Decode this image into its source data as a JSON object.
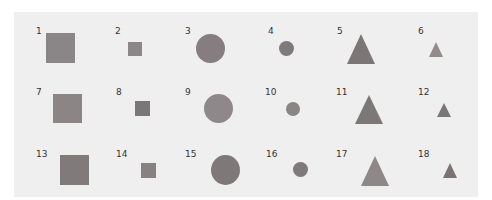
{
  "panel": {
    "background": "#efefef"
  },
  "items": [
    {
      "id": "1",
      "label": "1",
      "shape": "square",
      "size": "large",
      "color": "#8a8586",
      "lx": 36,
      "ly": 26,
      "x": 46,
      "y": 33,
      "w": 29,
      "h": 30
    },
    {
      "id": "2",
      "label": "2",
      "shape": "square",
      "size": "small",
      "color": "#8b8687",
      "lx": 115,
      "ly": 26,
      "x": 128,
      "y": 42,
      "w": 14,
      "h": 14
    },
    {
      "id": "3",
      "label": "3",
      "shape": "circle",
      "size": "large",
      "color": "#857d7f",
      "lx": 185,
      "ly": 26,
      "x": 196,
      "y": 34,
      "w": 29,
      "h": 29
    },
    {
      "id": "4",
      "label": "4",
      "shape": "circle",
      "size": "small",
      "color": "#7f7a7b",
      "lx": 268,
      "ly": 26,
      "x": 279,
      "y": 41,
      "w": 15,
      "h": 15
    },
    {
      "id": "5",
      "label": "5",
      "shape": "triangle",
      "size": "large",
      "color": "#7c7677",
      "lx": 337,
      "ly": 26,
      "x": 347,
      "y": 34,
      "w": 29,
      "h": 30
    },
    {
      "id": "6",
      "label": "6",
      "shape": "triangle",
      "size": "small",
      "color": "#918b8c",
      "lx": 418,
      "ly": 26,
      "x": 429,
      "y": 42,
      "w": 14,
      "h": 15
    },
    {
      "id": "7",
      "label": "7",
      "shape": "square",
      "size": "large",
      "color": "#8b8586",
      "lx": 36,
      "ly": 87,
      "x": 53,
      "y": 94,
      "w": 29,
      "h": 29
    },
    {
      "id": "8",
      "label": "8",
      "shape": "square",
      "size": "small",
      "color": "#7b7677",
      "lx": 116,
      "ly": 87,
      "x": 135,
      "y": 101,
      "w": 15,
      "h": 15
    },
    {
      "id": "9",
      "label": "9",
      "shape": "circle",
      "size": "large",
      "color": "#8f888a",
      "lx": 185,
      "ly": 87,
      "x": 204,
      "y": 94,
      "w": 29,
      "h": 29
    },
    {
      "id": "10",
      "label": "10",
      "shape": "circle",
      "size": "small",
      "color": "#8b8586",
      "lx": 265,
      "ly": 87,
      "x": 286,
      "y": 102,
      "w": 14,
      "h": 14
    },
    {
      "id": "11",
      "label": "11",
      "shape": "triangle",
      "size": "large",
      "color": "#7d7778",
      "lx": 336,
      "ly": 87,
      "x": 355,
      "y": 95,
      "w": 28,
      "h": 29
    },
    {
      "id": "12",
      "label": "12",
      "shape": "triangle",
      "size": "small",
      "color": "#7b7576",
      "lx": 418,
      "ly": 87,
      "x": 437,
      "y": 103,
      "w": 14,
      "h": 14
    },
    {
      "id": "13",
      "label": "13",
      "shape": "square",
      "size": "large",
      "color": "#807a7b",
      "lx": 36,
      "ly": 149,
      "x": 60,
      "y": 155,
      "w": 29,
      "h": 30
    },
    {
      "id": "14",
      "label": "14",
      "shape": "square",
      "size": "small",
      "color": "#878182",
      "lx": 116,
      "ly": 149,
      "x": 141,
      "y": 163,
      "w": 15,
      "h": 15
    },
    {
      "id": "15",
      "label": "15",
      "shape": "circle",
      "size": "large",
      "color": "#7e7879",
      "lx": 185,
      "ly": 149,
      "x": 211,
      "y": 155,
      "w": 29,
      "h": 30
    },
    {
      "id": "16",
      "label": "16",
      "shape": "circle",
      "size": "small",
      "color": "#7f797a",
      "lx": 266,
      "ly": 149,
      "x": 293,
      "y": 162,
      "w": 15,
      "h": 15
    },
    {
      "id": "17",
      "label": "17",
      "shape": "triangle",
      "size": "large",
      "color": "#8e8889",
      "lx": 336,
      "ly": 149,
      "x": 361,
      "y": 156,
      "w": 29,
      "h": 30
    },
    {
      "id": "18",
      "label": "18",
      "shape": "triangle",
      "size": "small",
      "color": "#797374",
      "lx": 418,
      "ly": 149,
      "x": 443,
      "y": 163,
      "w": 14,
      "h": 15
    }
  ]
}
